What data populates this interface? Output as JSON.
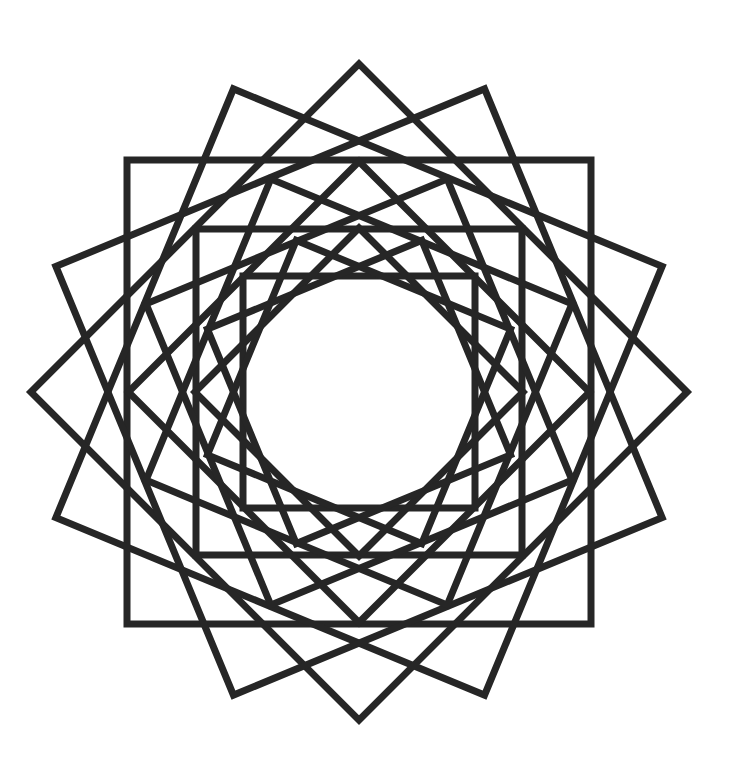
{
  "figure": {
    "width": 744,
    "height": 773,
    "background": "#ffffff",
    "stroke_color": "#262626",
    "stroke_width": 7,
    "center": [
      359,
      392
    ],
    "rings": [
      {
        "name": "outer",
        "half_size": 232,
        "rotations_deg": [
          0,
          22.5,
          45,
          67.5
        ]
      },
      {
        "name": "middle",
        "half_size": 163,
        "rotations_deg": [
          0,
          22.5,
          45,
          67.5
        ]
      },
      {
        "name": "inner",
        "half_size": 116,
        "rotations_deg": [
          0,
          22.5,
          45,
          67.5
        ]
      }
    ]
  }
}
